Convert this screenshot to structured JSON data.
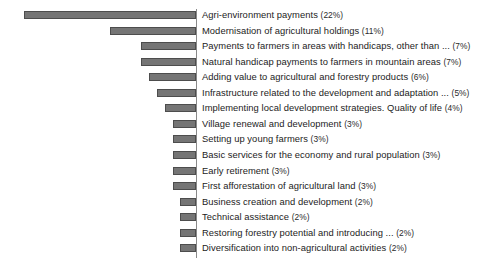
{
  "chart_data": {
    "type": "bar",
    "orientation": "horizontal",
    "title": "",
    "subtitle": "",
    "xlabel": "",
    "ylabel": "",
    "xlim": [
      0,
      22
    ],
    "grid": false,
    "legend": null,
    "bars_anchor": "right-aligned-to-axis, extending leftward",
    "value_unit": "%",
    "categories": [
      "Agri-environment payments",
      "Modernisation of agricultural holdings",
      "Payments to farmers in areas with handicaps, other than ...",
      "Natural handicap payments to farmers in mountain areas",
      "Adding value to agricultural and forestry products",
      "Infrastructure related to the development and adaptation ...",
      "Implementing local development strategies. Quality of life",
      "Village renewal and development",
      "Setting up young farmers",
      "Basic services for the economy and rural population",
      "Early retirement",
      "First afforestation of agricultural land",
      "Business creation and development",
      "Technical assistance",
      "Restoring forestry potential and introducing ...",
      "Diversification into non-agricultural activities"
    ],
    "values": [
      22,
      11,
      7,
      7,
      6,
      5,
      4,
      3,
      3,
      3,
      3,
      3,
      2,
      2,
      2,
      2
    ],
    "tick_labels": [],
    "colors": {
      "bar_fill": "#757575",
      "bar_stroke": "#4d4d4d",
      "axis": "#8a8a8a",
      "background": "#ffffff",
      "label_text": "#1c1c1c"
    }
  },
  "rows": [
    {
      "label": "Agri-environment payments",
      "pct": "(22%)",
      "value": 22
    },
    {
      "label": "Modernisation of agricultural holdings",
      "pct": "(11%)",
      "value": 11
    },
    {
      "label": "Payments to farmers in areas with handicaps, other than ...",
      "pct": "(7%)",
      "value": 7
    },
    {
      "label": "Natural handicap payments to farmers in mountain areas",
      "pct": "(7%)",
      "value": 7
    },
    {
      "label": "Adding value to agricultural and forestry products",
      "pct": "(6%)",
      "value": 6
    },
    {
      "label": "Infrastructure related to the development and adaptation ...",
      "pct": "(5%)",
      "value": 5
    },
    {
      "label": "Implementing local development strategies. Quality of life",
      "pct": "(4%)",
      "value": 4
    },
    {
      "label": "Village renewal and development",
      "pct": "(3%)",
      "value": 3
    },
    {
      "label": "Setting up young farmers",
      "pct": "(3%)",
      "value": 3
    },
    {
      "label": "Basic services for the economy and rural population",
      "pct": "(3%)",
      "value": 3
    },
    {
      "label": "Early retirement",
      "pct": "(3%)",
      "value": 3
    },
    {
      "label": "First afforestation of agricultural land",
      "pct": "(3%)",
      "value": 3
    },
    {
      "label": "Business creation and development",
      "pct": "(2%)",
      "value": 2
    },
    {
      "label": "Technical assistance",
      "pct": "(2%)",
      "value": 2
    },
    {
      "label": "Restoring forestry potential and introducing ...",
      "pct": "(2%)",
      "value": 2
    },
    {
      "label": "Diversification into non-agricultural activities",
      "pct": "(2%)",
      "value": 2
    }
  ],
  "layout": {
    "axis_x": 196,
    "first_row_top": 9,
    "row_pitch": 15.55,
    "bar_height": 8,
    "px_per_percent": 7.8,
    "label_x": 202
  }
}
